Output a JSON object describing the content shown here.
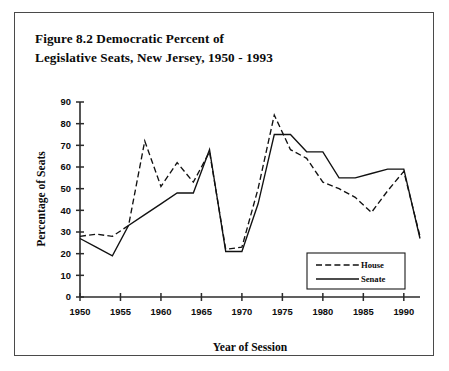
{
  "figure": {
    "title_line_1": "Figure 8.2 Democratic Percent of",
    "title_line_2": "Legislative Seats, New Jersey, 1950 - 1993"
  },
  "chart_data": {
    "type": "line",
    "title": "Figure 8.2 Democratic Percent of Legislative Seats, New Jersey, 1950 - 1993",
    "xlabel": "Year of Session",
    "ylabel": "Percentage of Seats",
    "xlim": [
      1950,
      1992
    ],
    "ylim": [
      0,
      90
    ],
    "xticks": [
      1950,
      1955,
      1960,
      1965,
      1970,
      1975,
      1980,
      1985,
      1990
    ],
    "yticks": [
      0,
      10,
      20,
      30,
      40,
      50,
      60,
      70,
      80,
      90
    ],
    "xtick_labels": [
      "1950",
      "1955",
      "1960",
      "1965",
      "1970",
      "1975",
      "1980",
      "1985",
      "1990"
    ],
    "ytick_labels": [
      "0",
      "10",
      "20",
      "30",
      "40",
      "50",
      "60",
      "70",
      "80",
      "90"
    ],
    "grid": false,
    "legend_position": "lower right",
    "x": [
      1950,
      1952,
      1954,
      1956,
      1958,
      1960,
      1962,
      1964,
      1966,
      1968,
      1970,
      1972,
      1974,
      1976,
      1978,
      1980,
      1982,
      1984,
      1986,
      1988,
      1990,
      1992
    ],
    "series": [
      {
        "name": "House",
        "style": "dashed",
        "color": "#111111",
        "values": [
          28,
          29,
          28,
          33,
          72,
          51,
          62,
          53,
          67,
          22,
          23,
          50,
          84,
          68,
          64,
          53,
          50,
          46,
          39,
          49,
          58,
          28
        ]
      },
      {
        "name": "Senate",
        "style": "solid",
        "color": "#111111",
        "values": [
          27,
          23,
          19,
          33,
          38,
          43,
          48,
          48,
          68,
          21,
          21,
          43,
          75,
          75,
          67,
          67,
          55,
          55,
          57,
          59,
          59,
          27
        ]
      }
    ],
    "legend": [
      {
        "label": "House",
        "style": "dashed"
      },
      {
        "label": "Senate",
        "style": "solid"
      }
    ]
  }
}
